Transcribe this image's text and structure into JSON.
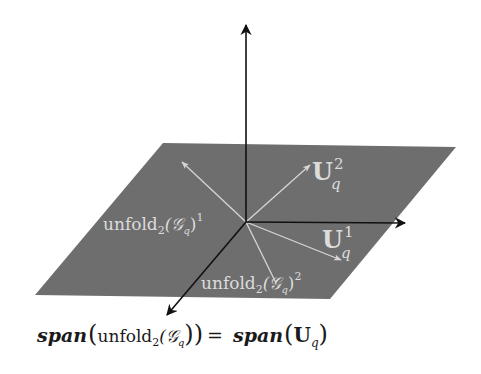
{
  "figure": {
    "colors": {
      "background": "#ffffff",
      "plane": "#6e6e6e",
      "axis": "#111111",
      "vector": "#d6d6d6",
      "plane_label": "#dcdcdc",
      "equation": "#1a1a1a"
    },
    "axes": {
      "origin": [
        246,
        222
      ],
      "vertical_tip": [
        246,
        23
      ],
      "horizontal_tip": [
        407,
        223
      ],
      "diagonal_tip": [
        166,
        317
      ]
    },
    "plane": {
      "corners": [
        [
          163,
          143
        ],
        [
          456,
          147
        ],
        [
          330,
          299
        ],
        [
          35,
          295
        ]
      ]
    },
    "vectors": [
      {
        "name": "unfold_1",
        "tip": [
          182,
          162
        ]
      },
      {
        "name": "U_q_2",
        "tip": [
          310,
          165
        ]
      },
      {
        "name": "U_q_1",
        "tip": [
          341,
          260
        ]
      },
      {
        "name": "unfold_2",
        "tip": [
          276,
          283
        ]
      }
    ],
    "labels": {
      "unfold_1": {
        "base": "unfold",
        "sub": "2",
        "arg": "(𝒢",
        "arg_sub": "q",
        "close": ")",
        "sup": "1"
      },
      "unfold_2": {
        "base": "unfold",
        "sub": "2",
        "arg": "(𝒢",
        "arg_sub": "q",
        "close": ")",
        "sup": "2"
      },
      "U_q_2": {
        "base": "U",
        "sub": "q",
        "sup": "2"
      },
      "U_q_1": {
        "base": "U",
        "sub": "q",
        "sup": "1"
      }
    },
    "equation": {
      "lhs_func": "span",
      "lhs_open": "(",
      "lhs_base": "unfold",
      "lhs_sub": "2",
      "lhs_arg": "(𝒢",
      "lhs_arg_sub": "q",
      "lhs_close": "))",
      "equals": "=",
      "rhs_func": "span",
      "rhs_open": "(",
      "rhs_base": "U",
      "rhs_sub": "q",
      "rhs_close": ")"
    }
  }
}
